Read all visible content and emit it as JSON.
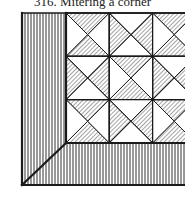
{
  "caption": {
    "number": "316.",
    "title": "Mitering a corner",
    "full": "316.  Mitering a corner"
  },
  "figure": {
    "ink_color": "#1a1a1a",
    "paper_color": "#ffffff",
    "border": {
      "stripe_direction": "vertical",
      "miter": "diagonal seam from inner corner to outer corner"
    },
    "blocks": {
      "rows": 3,
      "cols": 3,
      "block_type": "quarter-square triangles",
      "hatched_triangles": [
        [
          "top-bottom",
          "left-right",
          "top-bottom"
        ],
        [
          "left-right",
          "top-bottom",
          "left-right"
        ],
        [
          "top-bottom",
          "left-right",
          "top-bottom"
        ]
      ]
    }
  }
}
